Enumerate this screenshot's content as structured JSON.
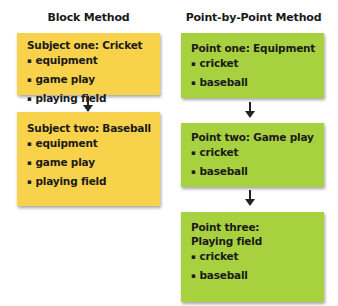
{
  "colors": {
    "block_box": "#f7d24a",
    "point_box": "#a8d13f",
    "arrow": "#222222"
  },
  "block_method": {
    "title": "Block Method",
    "boxes": [
      {
        "title": "Subject one: Cricket",
        "items": [
          "equipment",
          "game play",
          "playing field"
        ]
      },
      {
        "title": "Subject two: Baseball",
        "items": [
          "equipment",
          "game play",
          "playing field"
        ]
      }
    ]
  },
  "point_method": {
    "title": "Point-by-Point Method",
    "boxes": [
      {
        "title": "Point one: Equipment",
        "items": [
          "cricket",
          "baseball"
        ]
      },
      {
        "title": "Point two: Game play",
        "items": [
          "cricket",
          "baseball"
        ]
      },
      {
        "title": "Point three: Playing field",
        "items": [
          "cricket",
          "baseball"
        ]
      }
    ]
  }
}
